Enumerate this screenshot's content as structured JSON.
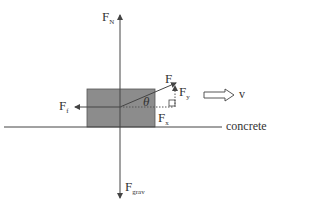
{
  "diagram": {
    "type": "free-body-diagram",
    "surface_label": "concrete",
    "velocity_label": "v",
    "angle_label": "θ",
    "forces": {
      "normal": {
        "main": "F",
        "sub": "N"
      },
      "friction": {
        "main": "F",
        "sub": "f"
      },
      "applied": {
        "main": "F",
        "sub": ""
      },
      "applied_x": {
        "main": "F",
        "sub": "x"
      },
      "applied_y": {
        "main": "F",
        "sub": "y"
      },
      "gravity": {
        "main": "F",
        "sub": "grav"
      }
    },
    "colors": {
      "block": "#8c8c8c",
      "lines": "#444444"
    }
  }
}
